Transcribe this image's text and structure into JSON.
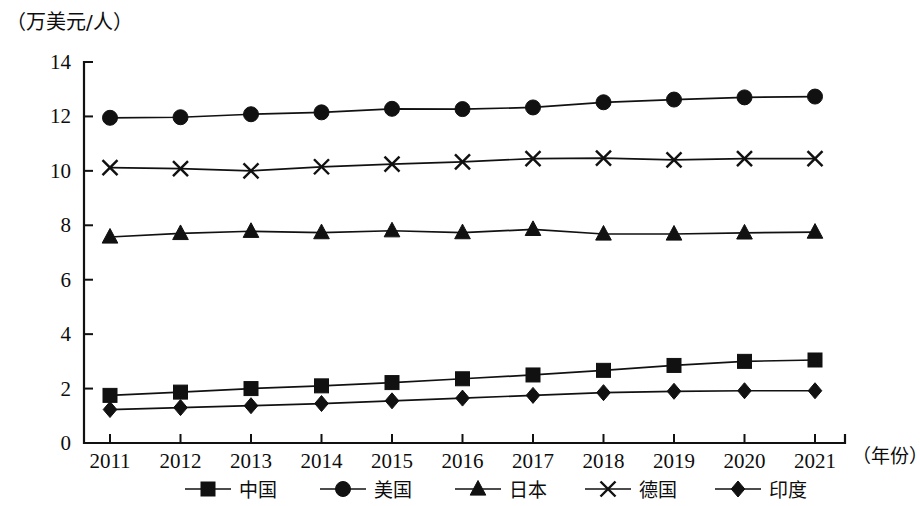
{
  "chart_data": {
    "type": "line",
    "title": "",
    "unit_label": "（万美元/人）",
    "xlabel": "（年份）",
    "ylabel": "",
    "ylim": [
      0,
      14
    ],
    "yticks": [
      "0",
      "2",
      "4",
      "6",
      "8",
      "10",
      "12",
      "14"
    ],
    "ytick_values": [
      0,
      2,
      4,
      6,
      8,
      10,
      12,
      14
    ],
    "grid": false,
    "legend_position": "bottom",
    "categories": [
      "2011",
      "2012",
      "2013",
      "2014",
      "2015",
      "2016",
      "2017",
      "2018",
      "2019",
      "2020",
      "2021"
    ],
    "series": [
      {
        "name": "中国",
        "marker": "square",
        "values": [
          1.75,
          1.87,
          2.0,
          2.1,
          2.22,
          2.36,
          2.5,
          2.67,
          2.85,
          3.0,
          3.05
        ]
      },
      {
        "name": "美国",
        "marker": "circle",
        "values": [
          11.95,
          11.97,
          12.08,
          12.15,
          12.28,
          12.27,
          12.33,
          12.52,
          12.62,
          12.7,
          12.73
        ]
      },
      {
        "name": "日本",
        "marker": "triangle",
        "values": [
          7.57,
          7.7,
          7.78,
          7.73,
          7.8,
          7.73,
          7.85,
          7.68,
          7.68,
          7.72,
          7.75
        ]
      },
      {
        "name": "德国",
        "marker": "cross",
        "values": [
          10.12,
          10.08,
          10.0,
          10.15,
          10.25,
          10.33,
          10.45,
          10.47,
          10.4,
          10.45,
          10.45
        ]
      },
      {
        "name": "印度",
        "marker": "diamond",
        "values": [
          1.23,
          1.3,
          1.37,
          1.45,
          1.55,
          1.65,
          1.75,
          1.85,
          1.9,
          1.92,
          1.92
        ]
      }
    ]
  },
  "legend": {
    "items": [
      {
        "label": "中国",
        "marker": "square"
      },
      {
        "label": "美国",
        "marker": "circle"
      },
      {
        "label": "日本",
        "marker": "triangle"
      },
      {
        "label": "德国",
        "marker": "cross"
      },
      {
        "label": "印度",
        "marker": "diamond"
      }
    ]
  }
}
